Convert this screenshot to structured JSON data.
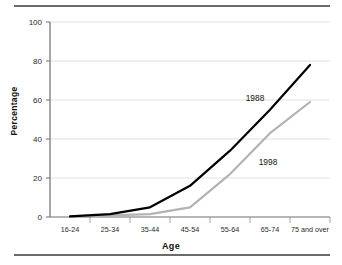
{
  "chart_data": {
    "type": "line",
    "title": "",
    "xlabel": "Age",
    "ylabel": "Percentage",
    "categories": [
      "16-24",
      "25-34",
      "35-44",
      "45-54",
      "55-64",
      "65-74",
      "75 and over"
    ],
    "ylim": [
      0,
      100
    ],
    "yticks": [
      0,
      20,
      40,
      60,
      80,
      100
    ],
    "grid": "horizontal",
    "legend": "inline-annotations",
    "series": [
      {
        "name": "1988",
        "color": "#000000",
        "values": [
          0.3,
          1.5,
          5,
          16,
          34,
          55,
          78
        ],
        "annotation": "1988"
      },
      {
        "name": "1998",
        "color": "#b3b3b3",
        "values": [
          0.2,
          0.8,
          1.5,
          5,
          22,
          43,
          59
        ],
        "annotation": "1998"
      }
    ]
  },
  "axis": {
    "y_title": "Percentage",
    "x_title": "Age",
    "y_tick_labels": [
      "0",
      "20",
      "40",
      "60",
      "80",
      "100"
    ],
    "x_tick_labels": [
      "16-24",
      "25-34",
      "35-44",
      "45-54",
      "55-64",
      "65-74",
      "75 and over"
    ]
  },
  "annotations": {
    "series_1988": "1988",
    "series_1998": "1998"
  }
}
